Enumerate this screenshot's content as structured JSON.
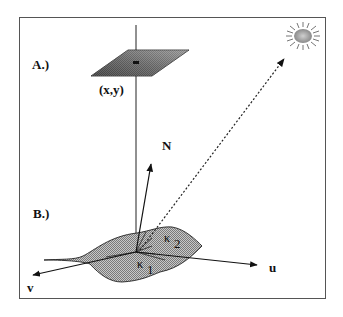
{
  "labels": {
    "panel_a": "A.)",
    "panel_b": "B.)",
    "pixel_coord": "(x,y)",
    "normal": "N",
    "u_axis": "u",
    "v_axis": "v",
    "kappa1": "κ",
    "kappa1_sub": "1",
    "kappa2": "κ",
    "kappa2_sub": "2"
  },
  "colors": {
    "line": "#222222",
    "fill_gray": "#9a9a9a",
    "plane_dark": "#3a3a3a",
    "frame": "#555555"
  }
}
